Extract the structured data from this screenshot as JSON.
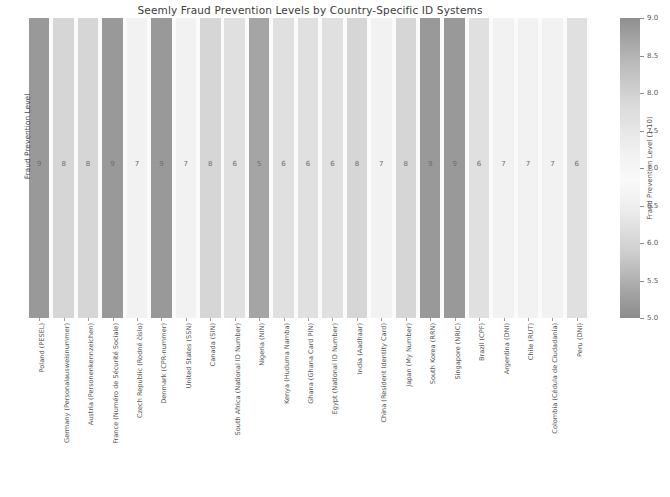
{
  "chart_data": {
    "type": "bar",
    "title": "Seemly Fraud Prevention Levels by Country-Specific ID Systems",
    "xlabel": "",
    "ylabel": "Fraud Prevention Level",
    "ylim": [
      0,
      10
    ],
    "grid": false,
    "legend": null,
    "colorbar": {
      "label": "Fraud Prevention Level (1-10)",
      "ticks": [
        "9.0",
        "8.5",
        "8.0",
        "7.5",
        "7.0",
        "6.5",
        "6.0",
        "5.5",
        "5.0"
      ],
      "vmin": 5.0,
      "vmax": 9.0,
      "colormap_note": "dark at both ends, light in the middle"
    },
    "categories": [
      "Poland (PESEL)",
      "Germany (Personalausweisnummer)",
      "Austria (Personenkennzeichen)",
      "France (Numéro de Sécurité Sociale)",
      "Czech Republic (Rodné číslo)",
      "Denmark (CPR-nummer)",
      "United States (SSN)",
      "Canada (SIN)",
      "South Africa (National ID Number)",
      "Nigeria (NIN)",
      "Kenya (Huduma Namba)",
      "Ghana (Ghana Card PIN)",
      "Egypt (National ID Number)",
      "India (Aadhaar)",
      "China (Resident Identity Card)",
      "Japan (My Number)",
      "South Korea (RRN)",
      "Singapore (NRIC)",
      "Brazil (CPF)",
      "Argentina (DNI)",
      "Chile (RUT)",
      "Colombia (Cédula de Ciudadanía)",
      "Peru (DNI)"
    ],
    "values": [
      9,
      8,
      8,
      9,
      7,
      9,
      7,
      8,
      6,
      5,
      6,
      6,
      6,
      8,
      7,
      8,
      9,
      9,
      6,
      7,
      7,
      7,
      6
    ],
    "bar_colors": [
      "#9a9a9a",
      "#d8d8d8",
      "#d8d8d8",
      "#9a9a9a",
      "#f4f4f4",
      "#9a9a9a",
      "#f4f4f4",
      "#d8d8d8",
      "#e2e2e2",
      "#a6a6a6",
      "#e2e2e2",
      "#e2e2e2",
      "#e2e2e2",
      "#d8d8d8",
      "#f4f4f4",
      "#d8d8d8",
      "#9a9a9a",
      "#9a9a9a",
      "#e2e2e2",
      "#f4f4f4",
      "#f4f4f4",
      "#f4f4f4",
      "#e2e2e2"
    ]
  }
}
